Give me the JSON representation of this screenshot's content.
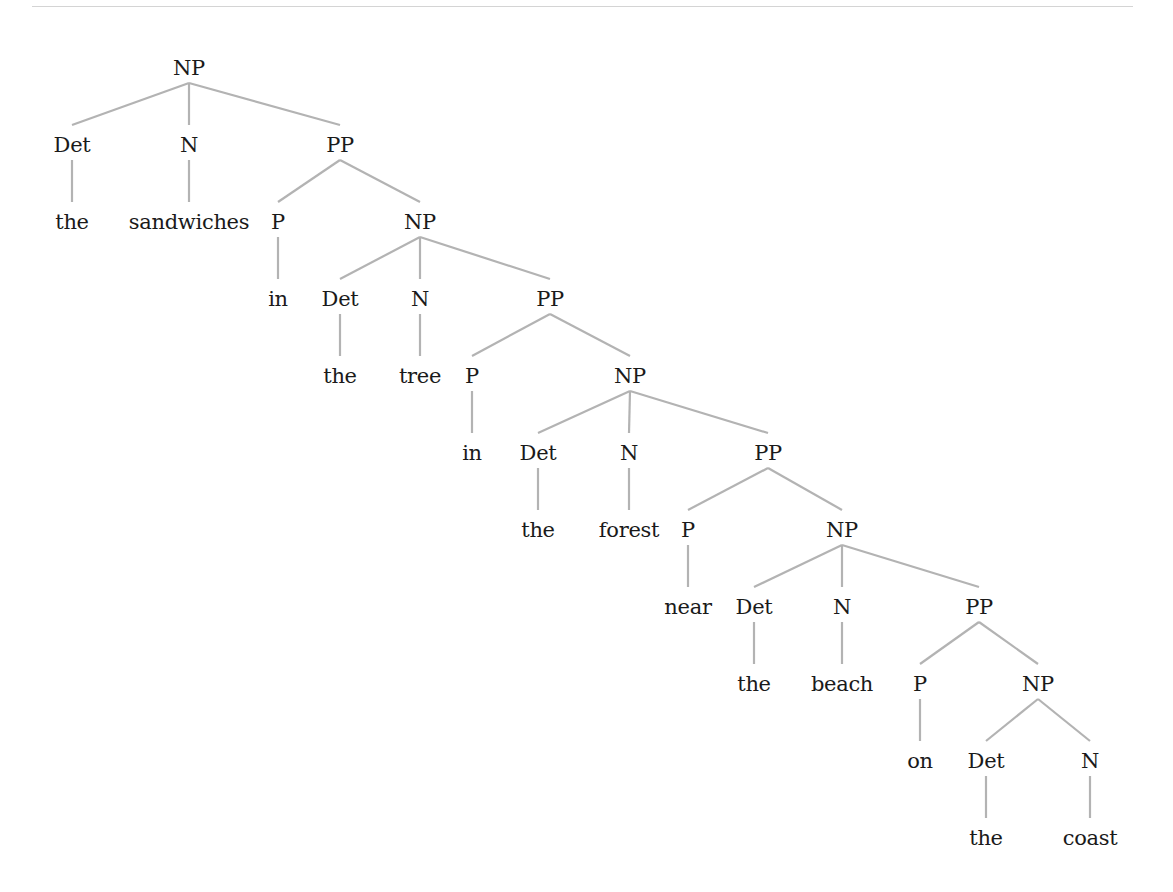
{
  "diagram": {
    "type": "syntax-tree",
    "phrase": "the sandwiches in the tree in the forest near the beach on the coast",
    "style": {
      "edge_color": "#b3b3b3",
      "text_color": "#1a1a1a",
      "rule_color": "#d4d4d4"
    },
    "layout": {
      "level_top": [
        56,
        133,
        210,
        287,
        364,
        441,
        518,
        595,
        672,
        749,
        826
      ],
      "label_height": 24,
      "edge_gap_top": 3,
      "edge_gap_bottom": 8
    },
    "nodes": [
      {
        "id": "np0",
        "label": "NP",
        "x": 189,
        "level": 0,
        "kind": "phrase"
      },
      {
        "id": "det1",
        "label": "Det",
        "x": 72,
        "level": 1,
        "kind": "category",
        "parent": "np0"
      },
      {
        "id": "n1",
        "label": "N",
        "x": 189,
        "level": 1,
        "kind": "category",
        "parent": "np0"
      },
      {
        "id": "pp1",
        "label": "PP",
        "x": 340,
        "level": 1,
        "kind": "phrase",
        "parent": "np0"
      },
      {
        "id": "w_the1",
        "label": "the",
        "x": 72,
        "level": 2,
        "kind": "word",
        "parent": "det1"
      },
      {
        "id": "w_sandwiches",
        "label": "sandwiches",
        "x": 189,
        "level": 2,
        "kind": "word",
        "parent": "n1"
      },
      {
        "id": "p2",
        "label": "P",
        "x": 278,
        "level": 2,
        "kind": "category",
        "parent": "pp1"
      },
      {
        "id": "np2",
        "label": "NP",
        "x": 420,
        "level": 2,
        "kind": "phrase",
        "parent": "pp1"
      },
      {
        "id": "w_in1",
        "label": "in",
        "x": 278,
        "level": 3,
        "kind": "word",
        "parent": "p2"
      },
      {
        "id": "det3",
        "label": "Det",
        "x": 340,
        "level": 3,
        "kind": "category",
        "parent": "np2"
      },
      {
        "id": "n3",
        "label": "N",
        "x": 420,
        "level": 3,
        "kind": "category",
        "parent": "np2"
      },
      {
        "id": "pp3",
        "label": "PP",
        "x": 550,
        "level": 3,
        "kind": "phrase",
        "parent": "np2"
      },
      {
        "id": "w_the2",
        "label": "the",
        "x": 340,
        "level": 4,
        "kind": "word",
        "parent": "det3"
      },
      {
        "id": "w_tree",
        "label": "tree",
        "x": 420,
        "level": 4,
        "kind": "word",
        "parent": "n3"
      },
      {
        "id": "p4",
        "label": "P",
        "x": 472,
        "level": 4,
        "kind": "category",
        "parent": "pp3"
      },
      {
        "id": "np4",
        "label": "NP",
        "x": 630,
        "level": 4,
        "kind": "phrase",
        "parent": "pp3"
      },
      {
        "id": "w_in2",
        "label": "in",
        "x": 472,
        "level": 5,
        "kind": "word",
        "parent": "p4"
      },
      {
        "id": "det5",
        "label": "Det",
        "x": 538,
        "level": 5,
        "kind": "category",
        "parent": "np4"
      },
      {
        "id": "n5",
        "label": "N",
        "x": 629,
        "level": 5,
        "kind": "category",
        "parent": "np4"
      },
      {
        "id": "pp5",
        "label": "PP",
        "x": 768,
        "level": 5,
        "kind": "phrase",
        "parent": "np4"
      },
      {
        "id": "w_the3",
        "label": "the",
        "x": 538,
        "level": 6,
        "kind": "word",
        "parent": "det5"
      },
      {
        "id": "w_forest",
        "label": "forest",
        "x": 629,
        "level": 6,
        "kind": "word",
        "parent": "n5"
      },
      {
        "id": "p6",
        "label": "P",
        "x": 688,
        "level": 6,
        "kind": "category",
        "parent": "pp5"
      },
      {
        "id": "np6",
        "label": "NP",
        "x": 842,
        "level": 6,
        "kind": "phrase",
        "parent": "pp5"
      },
      {
        "id": "w_near",
        "label": "near",
        "x": 688,
        "level": 7,
        "kind": "word",
        "parent": "p6"
      },
      {
        "id": "det7",
        "label": "Det",
        "x": 754,
        "level": 7,
        "kind": "category",
        "parent": "np6"
      },
      {
        "id": "n7",
        "label": "N",
        "x": 842,
        "level": 7,
        "kind": "category",
        "parent": "np6"
      },
      {
        "id": "pp7",
        "label": "PP",
        "x": 979,
        "level": 7,
        "kind": "phrase",
        "parent": "np6"
      },
      {
        "id": "w_the4",
        "label": "the",
        "x": 754,
        "level": 8,
        "kind": "word",
        "parent": "det7"
      },
      {
        "id": "w_beach",
        "label": "beach",
        "x": 842,
        "level": 8,
        "kind": "word",
        "parent": "n7"
      },
      {
        "id": "p8",
        "label": "P",
        "x": 920,
        "level": 8,
        "kind": "category",
        "parent": "pp7"
      },
      {
        "id": "np8",
        "label": "NP",
        "x": 1038,
        "level": 8,
        "kind": "phrase",
        "parent": "pp7"
      },
      {
        "id": "w_on",
        "label": "on",
        "x": 920,
        "level": 9,
        "kind": "word",
        "parent": "p8"
      },
      {
        "id": "det9",
        "label": "Det",
        "x": 986,
        "level": 9,
        "kind": "category",
        "parent": "np8"
      },
      {
        "id": "n9",
        "label": "N",
        "x": 1090,
        "level": 9,
        "kind": "category",
        "parent": "np8"
      },
      {
        "id": "w_the5",
        "label": "the",
        "x": 986,
        "level": 10,
        "kind": "word",
        "parent": "det9"
      },
      {
        "id": "w_coast",
        "label": "coast",
        "x": 1090,
        "level": 10,
        "kind": "word",
        "parent": "n9"
      }
    ]
  }
}
